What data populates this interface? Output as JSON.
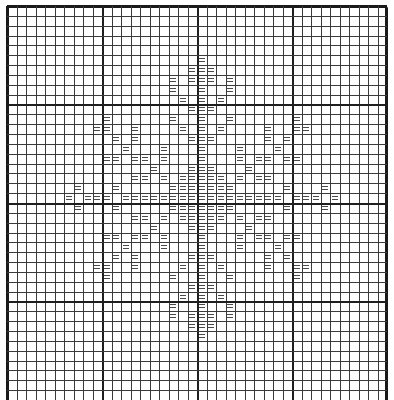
{
  "chart": {
    "type": "knitting-pattern-grid",
    "columns": 40,
    "rows": 40,
    "thick_line_every": 10,
    "symbol": "=",
    "symbol_name": "double-bar-stitch",
    "colors": {
      "background": "#ffffff",
      "grid_line": "#3a3a3a",
      "thick_line": "#1e1e1e",
      "symbol": "#4a4a4a"
    },
    "marked_cells": {
      "5": [
        20
      ],
      "6": [
        19,
        20,
        21
      ],
      "7": [
        17,
        19,
        20,
        21,
        23
      ],
      "8": [
        17,
        20,
        23
      ],
      "9": [
        18,
        20,
        22
      ],
      "10": [
        19,
        20,
        21
      ],
      "11": [
        10,
        17,
        20,
        23,
        30
      ],
      "12": [
        9,
        10,
        13,
        18,
        20,
        22,
        27,
        30,
        31
      ],
      "13": [
        11,
        13,
        19,
        20,
        21,
        27,
        29
      ],
      "14": [
        12,
        16,
        20,
        24,
        28
      ],
      "15": [
        10,
        11,
        13,
        14,
        16,
        20,
        24,
        26,
        27,
        29,
        30
      ],
      "16": [
        15,
        19,
        20,
        21,
        25
      ],
      "17": [
        13,
        14,
        16,
        18,
        19,
        20,
        21,
        22,
        24,
        26,
        27
      ],
      "18": [
        7,
        11,
        17,
        18,
        19,
        20,
        21,
        22,
        23,
        29,
        33
      ],
      "19": [
        6,
        8,
        9,
        10,
        12,
        13,
        14,
        15,
        16,
        17,
        18,
        19,
        20,
        21,
        22,
        23,
        24,
        25,
        26,
        27,
        28,
        30,
        31,
        32,
        34
      ],
      "20": [
        7,
        11,
        17,
        18,
        19,
        20,
        21,
        22,
        23,
        29,
        33
      ],
      "21": [
        13,
        14,
        16,
        18,
        19,
        20,
        21,
        22,
        24,
        26,
        27
      ],
      "22": [
        15,
        19,
        20,
        21,
        25
      ],
      "23": [
        10,
        11,
        13,
        14,
        16,
        20,
        24,
        26,
        27,
        29,
        30
      ],
      "24": [
        12,
        16,
        20,
        24,
        28
      ],
      "25": [
        11,
        13,
        19,
        20,
        21,
        27,
        29
      ],
      "26": [
        9,
        10,
        13,
        18,
        20,
        22,
        27,
        30,
        31
      ],
      "27": [
        10,
        17,
        20,
        23,
        30
      ],
      "28": [
        19,
        20,
        21
      ],
      "29": [
        18,
        20,
        22
      ],
      "30": [
        17,
        20,
        23
      ],
      "31": [
        17,
        19,
        20,
        21,
        23
      ],
      "32": [
        19,
        20,
        21
      ],
      "33": [
        20
      ]
    }
  }
}
